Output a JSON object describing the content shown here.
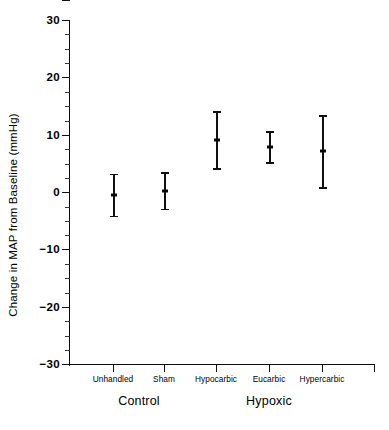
{
  "chart_data": {
    "type": "scatter",
    "title": "",
    "xlabel": "",
    "ylabel": "Change in MAP from Baseline (mmHg)",
    "ylim": [
      -30,
      30
    ],
    "yticks": [
      30,
      20,
      10,
      0,
      -10,
      -20,
      -30
    ],
    "ytick_labels": [
      "30",
      "20",
      "10",
      "0",
      "−10",
      "−20",
      "−30"
    ],
    "minor_tick_interval": 2.5,
    "grid": false,
    "legend": null,
    "error_type": "mean with error bars",
    "categories": [
      "Unhandled",
      "Sham",
      "Hypocarbic",
      "Eucarbic",
      "Hypercarbic"
    ],
    "groups": [
      {
        "label": "Control",
        "categories": [
          "Unhandled",
          "Sham"
        ]
      },
      {
        "label": "Hypoxic",
        "categories": [
          "Hypocarbic",
          "Eucarbic",
          "Hypercarbic"
        ]
      }
    ],
    "points": [
      {
        "category": "Unhandled",
        "mean": -0.5,
        "lower": -4.4,
        "upper": 3.2
      },
      {
        "category": "Sham",
        "mean": 0.2,
        "lower": -3.2,
        "upper": 3.5
      },
      {
        "category": "Hypocarbic",
        "mean": 9.0,
        "lower": 3.9,
        "upper": 14.1
      },
      {
        "category": "Eucarbic",
        "mean": 7.9,
        "lower": 4.9,
        "upper": 10.6
      },
      {
        "category": "Hypercarbic",
        "mean": 7.2,
        "lower": 0.5,
        "upper": 13.4
      }
    ],
    "series": [
      {
        "name": "Change in MAP",
        "values": [
          -0.5,
          0.2,
          9.0,
          7.9,
          7.2
        ],
        "lower": [
          -4.4,
          -3.2,
          3.9,
          4.9,
          0.5
        ],
        "upper": [
          3.2,
          3.5,
          14.1,
          10.6,
          13.4
        ]
      }
    ],
    "colors": {
      "ink": "#101010",
      "background": "#ffffff"
    }
  },
  "axis": {
    "y_title": "Change in MAP from Baseline (mmHg)",
    "ticks": [
      {
        "label": "30",
        "value": 30
      },
      {
        "label": "20",
        "value": 20
      },
      {
        "label": "10",
        "value": 10
      },
      {
        "label": "0",
        "value": 0
      },
      {
        "label": "−10",
        "value": -10
      },
      {
        "label": "−20",
        "value": -20
      },
      {
        "label": "−30",
        "value": -30
      }
    ]
  },
  "categories": [
    {
      "label": "Unhandled",
      "x": 113
    },
    {
      "label": "Sham",
      "x": 164
    },
    {
      "label": "Hypocarbic",
      "x": 216
    },
    {
      "label": "Eucarbic",
      "x": 269
    },
    {
      "label": "Hypercarbic",
      "x": 322
    }
  ],
  "groups": [
    {
      "label": "Control",
      "x": 139
    },
    {
      "label": "Hypoxic",
      "x": 269
    }
  ]
}
